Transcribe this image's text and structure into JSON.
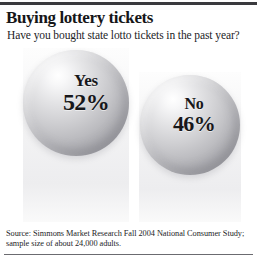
{
  "header": {
    "title": "Buying lottery tickets",
    "subtitle": "Have you bought state lotto tickets in the past year?"
  },
  "chart_data": {
    "type": "pie",
    "title": "Buying lottery tickets",
    "subtitle": "Have you bought state lotto tickets in the past year?",
    "categories": [
      "Yes",
      "No"
    ],
    "values": [
      52,
      46
    ],
    "value_labels": [
      "52%",
      "46%"
    ],
    "unit": "percent",
    "xlabel": "",
    "ylabel": "",
    "ylim": [
      0,
      100
    ],
    "grid": false,
    "legend": "none",
    "note": "Values shown as labeled 3D spheres sized proportionally; sizes not summing to 100% (remainder unstated)."
  },
  "balls": [
    {
      "answer": "Yes",
      "percent": "52%"
    },
    {
      "answer": "No",
      "percent": "46%"
    }
  ],
  "footer": {
    "source_line1": "Source: Simmons Market Research Fall 2004 National Consumer Study;",
    "source_line2": "sample size of about 24,000 adults."
  },
  "colors": {
    "rule_top": "#3a3a3e",
    "rule_bottom": "#6b6b70",
    "text": "#17171a",
    "background": "#ffffff",
    "sphere_light": "#ffffff",
    "sphere_dark": "#9b9ba1"
  }
}
